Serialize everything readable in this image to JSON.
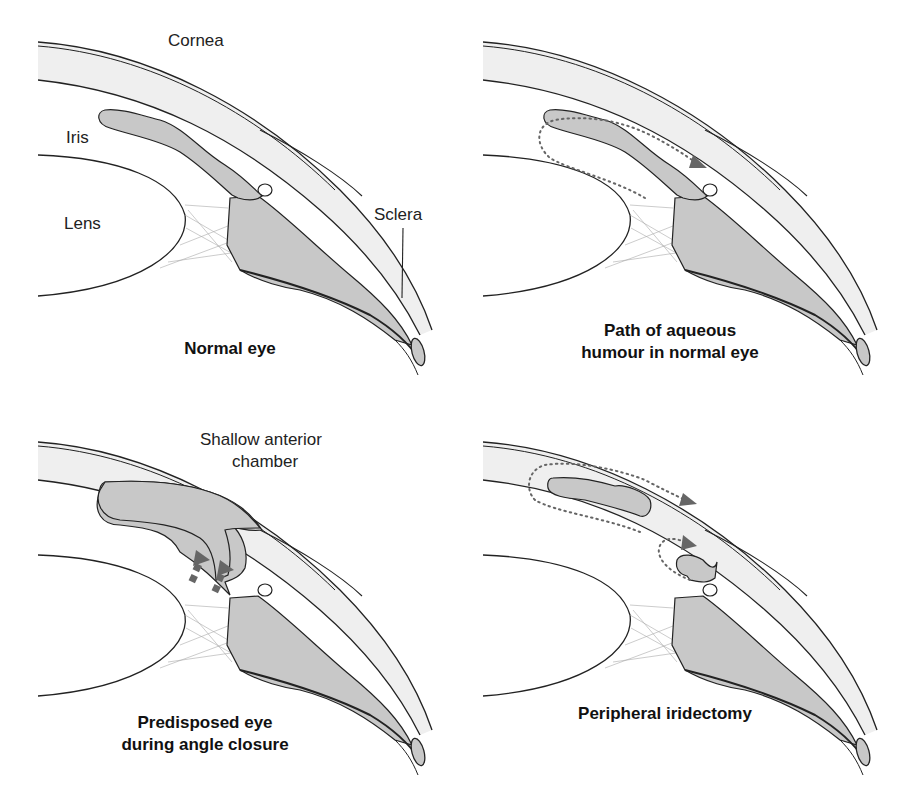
{
  "figure": {
    "panels": [
      {
        "id": "normal-eye",
        "caption": "Normal eye",
        "labels": {
          "cornea": "Cornea",
          "iris": "Iris",
          "lens": "Lens",
          "sclera": "Sclera"
        }
      },
      {
        "id": "aqueous-path",
        "caption_line1": "Path of aqueous",
        "caption_line2": "humour in normal eye"
      },
      {
        "id": "angle-closure",
        "caption_line1": "Predisposed eye",
        "caption_line2": "during angle closure",
        "labels": {
          "chamber_line1": "Shallow anterior",
          "chamber_line2": "chamber"
        }
      },
      {
        "id": "iridectomy",
        "caption": "Peripheral iridectomy"
      }
    ],
    "colors": {
      "tissue_fill": "#c8c8c8",
      "cornea_fill": "#efefef",
      "outline": "#222222",
      "zonule": "#aaaaaa",
      "flow_arrow": "#666666"
    },
    "icons": [
      "dotted-flow-arrow-icon",
      "pushing-arrow-icon"
    ]
  }
}
